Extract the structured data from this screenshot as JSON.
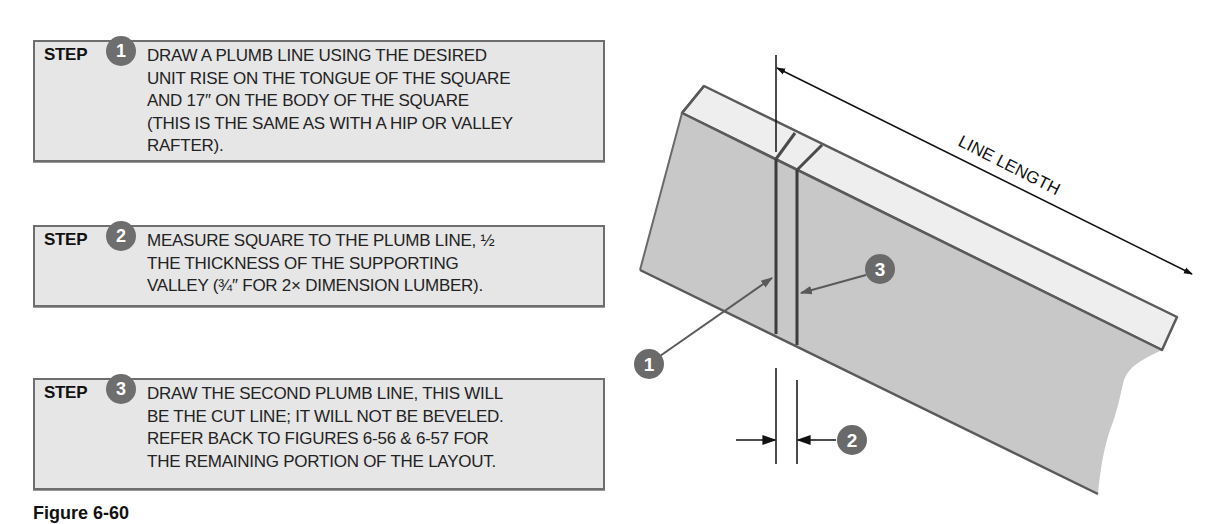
{
  "steps": [
    {
      "label": "STEP",
      "number": "1",
      "text": "DRAW A PLUMB LINE USING THE DESIRED\nUNIT RISE ON THE TONGUE OF THE SQUARE\nAND 17″ ON THE BODY OF THE SQUARE\n(THIS IS THE SAME AS WITH A HIP OR VALLEY\nRAFTER)."
    },
    {
      "label": "STEP",
      "number": "2",
      "text": "MEASURE SQUARE TO THE PLUMB LINE, ½\nTHE THICKNESS OF THE SUPPORTING\nVALLEY (¾″ FOR 2× DIMENSION LUMBER)."
    },
    {
      "label": "STEP",
      "number": "3",
      "text": "DRAW THE SECOND PLUMB LINE, THIS WILL\nBE THE CUT LINE; IT WILL NOT BE BEVELED.\nREFER BACK TO FIGURES 6-56 & 6-57 FOR\nTHE REMAINING PORTION OF THE LAYOUT."
    }
  ],
  "diagram": {
    "dimension_label": "LINE LENGTH",
    "callouts": {
      "first_plumb_line": "1",
      "offset_measure": "2",
      "second_plumb_line": "3"
    }
  },
  "caption": {
    "figure_label": "Figure 6-60",
    "description": ""
  },
  "colors": {
    "box_fill": "#e6e6e6",
    "box_border": "#6e6e6e",
    "badge_fill": "#6e6e6e",
    "board_front": "#c8c8c8",
    "board_top": "#eeeeee",
    "board_edge": "#5a5a5a",
    "plumb_line": "#3c3c3c"
  }
}
